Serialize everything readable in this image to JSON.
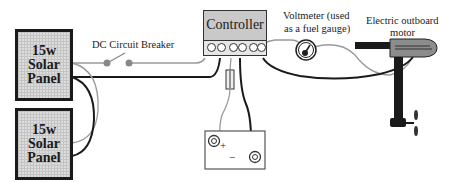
{
  "panels": [
    {
      "line1": "15w",
      "line2": "Solar",
      "line3": "Panel"
    },
    {
      "line1": "15w",
      "line2": "Solar",
      "line3": "Panel"
    }
  ],
  "breaker": {
    "label": "DC Circuit Breaker"
  },
  "controller": {
    "label": "Controller",
    "terminal_count": 6
  },
  "voltmeter": {
    "label_line1": "Voltmeter (used",
    "label_line2": "as a fuel gauge)"
  },
  "motor": {
    "label_line1": "Electric outboard",
    "label_line2": "motor"
  },
  "battery": {
    "positive": "+",
    "negative": "−"
  },
  "fuse": {
    "icon": "fuse-icon"
  },
  "colors": {
    "wire_dark": "#1a1a1a",
    "wire_light": "#9a9a9a",
    "panel_fill": "#dcdcdc",
    "controller_fill": "#c9c9c9",
    "motor_body": "#8c8c8c"
  }
}
